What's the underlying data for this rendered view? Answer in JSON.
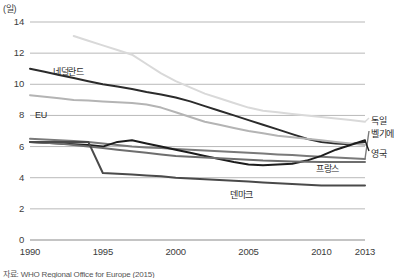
{
  "axis": {
    "unit_label": "(일)",
    "y_ticks": [
      0,
      2,
      4,
      6,
      8,
      10,
      12,
      14
    ],
    "x_ticks": [
      "1990",
      "1995",
      "2000",
      "2005",
      "2010",
      "2013"
    ]
  },
  "source": {
    "text": "자료: WHO Regional Office for Europe (2015)"
  },
  "inline_labels": [
    {
      "name": "netherlands",
      "text": "네덜란드"
    },
    {
      "name": "eu",
      "text": "EU"
    },
    {
      "name": "denmark",
      "text": "덴마크"
    },
    {
      "name": "france",
      "text": "프랑스"
    }
  ],
  "right_labels": [
    {
      "name": "germany",
      "text": "독일"
    },
    {
      "name": "belgium",
      "text": "벨기에"
    },
    {
      "name": "uk",
      "text": "영국"
    }
  ],
  "chart_data": {
    "type": "line",
    "title": "",
    "xlabel": "",
    "ylabel": "(일)",
    "xlim": [
      1990,
      2013
    ],
    "ylim": [
      0,
      14
    ],
    "grid": true,
    "legend": "inline-and-right-edge",
    "x": [
      1990,
      1991,
      1992,
      1993,
      1994,
      1995,
      1996,
      1997,
      1998,
      1999,
      2000,
      2001,
      2002,
      2003,
      2004,
      2005,
      2006,
      2007,
      2008,
      2009,
      2010,
      2011,
      2012,
      2013
    ],
    "series": [
      {
        "name": "네덜란드",
        "name_en": "Netherlands",
        "color": "#2b2b2b",
        "width": 2.0,
        "values": [
          11.0,
          10.8,
          10.6,
          10.4,
          10.2,
          10.0,
          9.85,
          9.7,
          9.5,
          9.35,
          9.15,
          8.9,
          8.6,
          8.3,
          8.0,
          7.7,
          7.4,
          7.1,
          6.8,
          6.5,
          6.3,
          6.2,
          6.15,
          6.3
        ]
      },
      {
        "name": "EU",
        "name_en": "European Union",
        "color": "#b4b4b4",
        "width": 2.0,
        "values": [
          9.3,
          9.2,
          9.1,
          9.0,
          8.95,
          8.9,
          8.85,
          8.8,
          8.7,
          8.5,
          8.2,
          7.9,
          7.6,
          7.4,
          7.2,
          7.0,
          6.85,
          6.7,
          6.6,
          6.5,
          6.4,
          6.3,
          6.2,
          6.1
        ]
      },
      {
        "name": "독일",
        "name_en": "Germany",
        "color": "#d9d9d9",
        "width": 2.0,
        "values": [
          null,
          null,
          null,
          13.1,
          12.8,
          12.5,
          12.2,
          11.9,
          11.3,
          10.7,
          10.2,
          9.8,
          9.4,
          9.1,
          8.8,
          8.5,
          8.3,
          8.2,
          8.1,
          8.0,
          7.9,
          7.8,
          7.7,
          7.6
        ]
      },
      {
        "name": "벨기에",
        "name_en": "Belgium",
        "color": "#7a7a7a",
        "width": 2.0,
        "values": [
          6.5,
          6.45,
          6.4,
          6.35,
          6.3,
          6.2,
          6.1,
          6.0,
          5.95,
          5.9,
          5.85,
          5.8,
          5.75,
          5.7,
          5.65,
          5.6,
          5.55,
          5.5,
          5.45,
          5.4,
          5.35,
          5.3,
          5.25,
          5.2
        ]
      },
      {
        "name": "영국",
        "name_en": "United Kingdom",
        "color": "#1c1c1c",
        "width": 2.0,
        "values": [
          6.3,
          6.25,
          6.2,
          6.15,
          6.1,
          6.0,
          6.3,
          6.4,
          6.2,
          6.0,
          5.8,
          5.6,
          5.4,
          5.2,
          5.0,
          4.85,
          4.8,
          4.85,
          4.9,
          5.1,
          5.4,
          5.8,
          6.1,
          6.4
        ]
      },
      {
        "name": "프랑스",
        "name_en": "France",
        "color": "#6e6e6e",
        "width": 2.0,
        "values": [
          6.3,
          6.25,
          6.2,
          6.1,
          6.0,
          5.9,
          5.8,
          5.7,
          5.6,
          5.5,
          5.4,
          5.35,
          5.3,
          5.25,
          5.2,
          5.15,
          5.1,
          5.08,
          5.05,
          5.03,
          5.0,
          5.0,
          5.0,
          5.0
        ]
      },
      {
        "name": "덴마크",
        "name_en": "Denmark",
        "color": "#4a4a4a",
        "width": 2.0,
        "values": [
          6.3,
          6.3,
          6.3,
          6.3,
          6.3,
          4.3,
          4.25,
          4.2,
          4.15,
          4.1,
          4.0,
          3.95,
          3.9,
          3.85,
          3.8,
          3.75,
          3.7,
          3.65,
          3.6,
          3.55,
          3.5,
          3.5,
          3.5,
          3.5
        ]
      }
    ]
  }
}
